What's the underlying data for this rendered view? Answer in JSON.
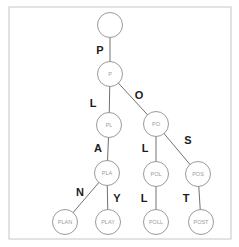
{
  "trie": {
    "nodes": {
      "root": "",
      "p": "P",
      "pl": "PL",
      "po": "PO",
      "pla": "PLA",
      "pol": "POL",
      "pos": "POS",
      "plan": "PLAN",
      "play": "PLAY",
      "poll": "POLL",
      "post": "POST"
    },
    "edges": {
      "root_p": "P",
      "p_pl": "L",
      "p_po": "O",
      "pl_pla": "A",
      "po_pol": "L",
      "po_pos": "S",
      "pla_plan": "N",
      "pla_play": "Y",
      "pol_poll": "L",
      "pos_post": "T"
    },
    "colors": {
      "background": "#ffffff",
      "border": "#c6c6c6",
      "edge_line": "#606060",
      "edge_label": "#1c1c1c",
      "node_stroke": "#8f8f8f",
      "node_fill": "#ffffff",
      "node_text": "#9b9b9b"
    }
  }
}
